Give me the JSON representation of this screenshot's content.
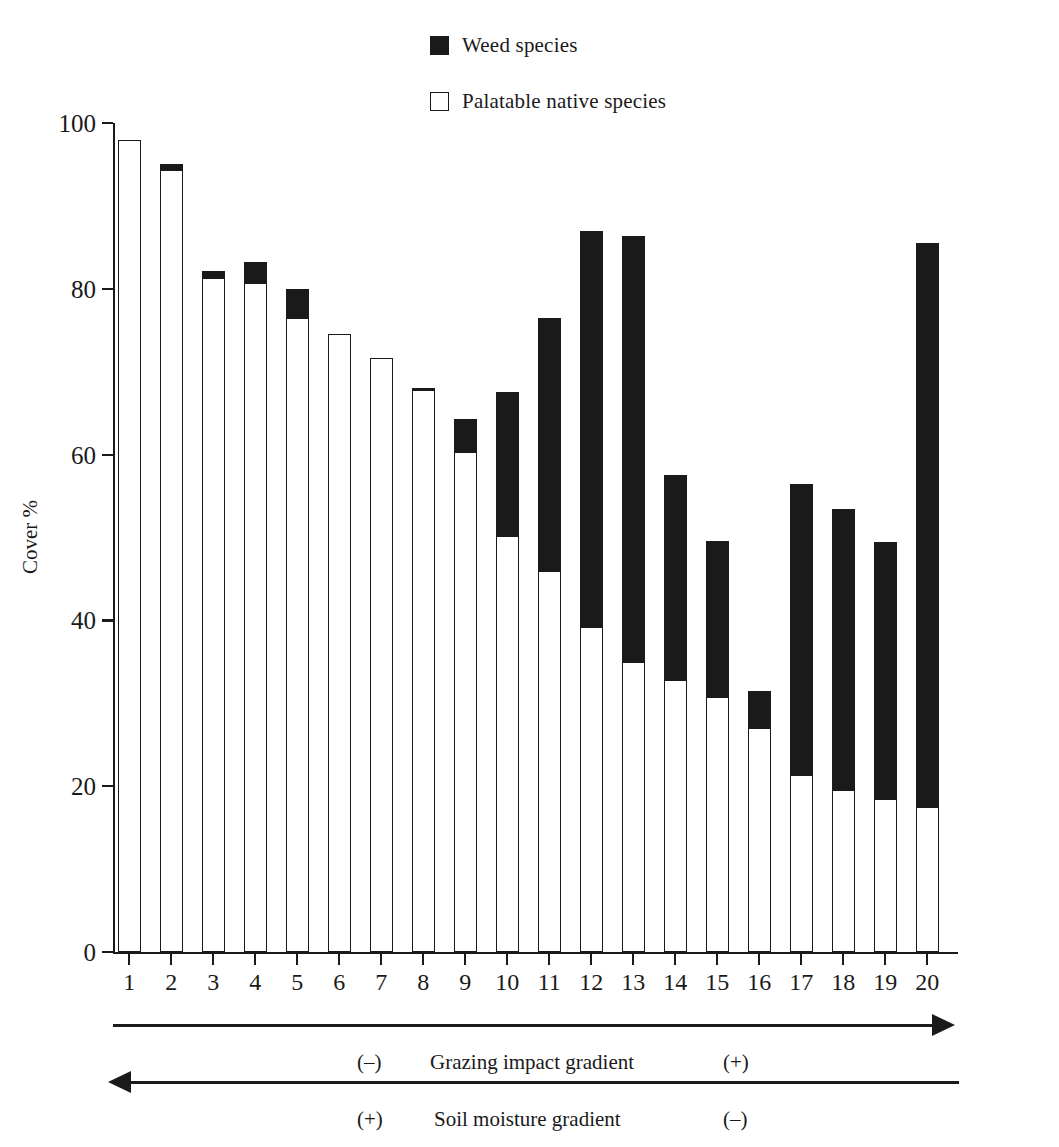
{
  "legend": {
    "items": [
      {
        "label": "Weed species",
        "style": "filled",
        "color": "#1a1a1a",
        "icon": "filled-square-icon"
      },
      {
        "label": "Palatable native species",
        "style": "hollow",
        "color": "#ffffff",
        "icon": "hollow-square-icon"
      }
    ]
  },
  "axes": {
    "y_title": "Cover %",
    "y_ticks": [
      "0",
      "20",
      "40",
      "60",
      "80",
      "100"
    ],
    "x_ticks": [
      "1",
      "2",
      "3",
      "4",
      "5",
      "6",
      "7",
      "8",
      "9",
      "10",
      "11",
      "12",
      "13",
      "14",
      "15",
      "16",
      "17",
      "18",
      "19",
      "20"
    ]
  },
  "annotations": {
    "grazing": {
      "minus": "(–)",
      "title": "Grazing impact gradient",
      "plus": "(+)",
      "direction": "right"
    },
    "moisture": {
      "plus": "(+)",
      "title": "Soil moisture gradient",
      "minus": "(–)",
      "direction": "left"
    }
  },
  "chart_data": {
    "type": "bar",
    "stacked": true,
    "title": "",
    "xlabel": "",
    "ylabel": "Cover %",
    "ylim": [
      0,
      100
    ],
    "ytick_step": 20,
    "grid": false,
    "legend_position": "top-center",
    "categories": [
      "1",
      "2",
      "3",
      "4",
      "5",
      "6",
      "7",
      "8",
      "9",
      "10",
      "11",
      "12",
      "13",
      "14",
      "15",
      "16",
      "17",
      "18",
      "19",
      "20"
    ],
    "series": [
      {
        "name": "Palatable native species",
        "color": "#ffffff",
        "values": [
          98.0,
          94.3,
          81.3,
          80.7,
          76.5,
          74.5,
          71.7,
          67.8,
          60.3,
          50.2,
          46.0,
          39.2,
          35.0,
          32.8,
          30.8,
          27.0,
          21.3,
          19.5,
          18.5,
          17.5
        ]
      },
      {
        "name": "Weed species",
        "color": "#1a1a1a",
        "values": [
          0.0,
          0.7,
          0.9,
          2.5,
          3.5,
          0.0,
          0.0,
          0.2,
          4.0,
          17.3,
          30.5,
          47.8,
          51.4,
          24.7,
          18.8,
          4.5,
          35.2,
          34.0,
          31.0,
          68.0
        ]
      }
    ],
    "totals": [
      98.0,
      95.0,
      82.2,
      83.2,
      80.0,
      74.5,
      71.7,
      68.0,
      64.3,
      67.5,
      76.5,
      87.0,
      86.4,
      57.5,
      49.6,
      31.5,
      56.5,
      53.5,
      49.5,
      85.5
    ]
  }
}
